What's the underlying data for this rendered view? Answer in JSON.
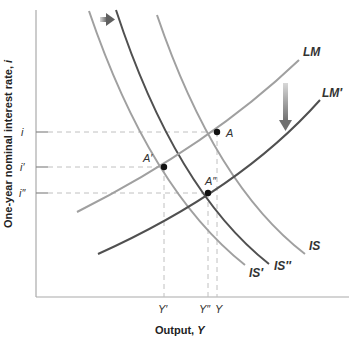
{
  "diagram": {
    "type": "IS-LM",
    "axes": {
      "x_label": "Output, ",
      "x_var": "Y",
      "y_label": "One-year nominal interest rate, ",
      "y_var": "i"
    },
    "y_ticks": [
      "i",
      "i′",
      "i″"
    ],
    "x_ticks": [
      "Y′",
      "Y″",
      "Y"
    ],
    "curves": {
      "lm": "LM",
      "lm_prime": "LM′",
      "is": "IS",
      "is_prime": "IS′",
      "is_double_prime": "IS″"
    },
    "points": {
      "a": "A",
      "a_prime": "A′",
      "a_double_prime": "A″"
    },
    "colors": {
      "light_curve": "#a0a0a0",
      "dark_curve": "#505050",
      "axis": "#aaaaaa",
      "dash": "#c0c0c0"
    }
  }
}
